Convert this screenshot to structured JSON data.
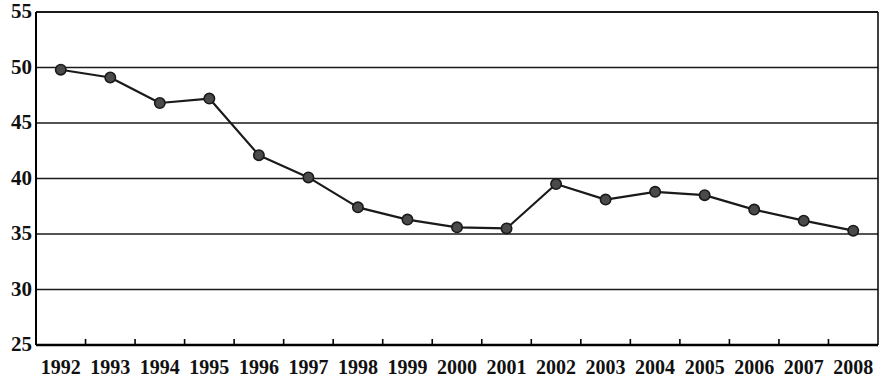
{
  "chart_data": {
    "type": "line",
    "title": "",
    "subtitle": "",
    "xlabel": "",
    "ylabel": "",
    "categories": [
      "1992",
      "1993",
      "1994",
      "1995",
      "1996",
      "1997",
      "1998",
      "1999",
      "2000",
      "2001",
      "2002",
      "2003",
      "2004",
      "2005",
      "2006",
      "2007",
      "2008"
    ],
    "values": [
      49.8,
      49.1,
      46.8,
      47.2,
      42.1,
      40.1,
      37.4,
      36.3,
      35.6,
      35.5,
      39.5,
      38.1,
      38.8,
      38.5,
      37.2,
      36.2,
      35.3
    ],
    "series": [
      {
        "name": "",
        "values": [
          49.8,
          49.1,
          46.8,
          47.2,
          42.1,
          40.1,
          37.4,
          36.3,
          35.6,
          35.5,
          39.5,
          38.1,
          38.8,
          38.5,
          37.2,
          36.2,
          35.3
        ]
      }
    ],
    "ylim": [
      25,
      55
    ],
    "ytick_labels": [
      "55",
      "50",
      "45",
      "40",
      "35",
      "30",
      "25"
    ],
    "ytick_values": [
      55,
      50,
      45,
      40,
      35,
      30,
      25
    ],
    "xtick_labels": [
      "1992",
      "1993",
      "1994",
      "1995",
      "1996",
      "1997",
      "1998",
      "1999",
      "2000",
      "2001",
      "2002",
      "2003",
      "2004",
      "2005",
      "2006",
      "2007",
      "2008"
    ],
    "grid": true,
    "grid_axis": "y",
    "legend": "none",
    "annotations": [],
    "marker": "circle",
    "marker_color": "#4a4a4a",
    "marker_edge_color": "#1a1a1a",
    "line_color": "#1a1a1a",
    "grid_color": "#1a1a1a",
    "axis_color": "#000000",
    "background_color": "#ffffff"
  }
}
